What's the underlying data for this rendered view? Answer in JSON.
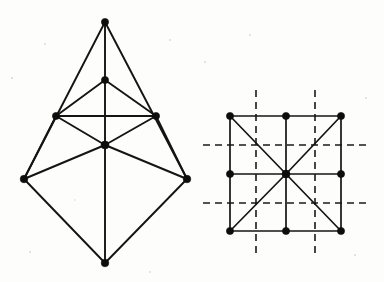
{
  "page": {
    "background_color": "#fdfdfb",
    "ink_color": "#141414",
    "width": 384,
    "height": 282
  },
  "figures": [
    {
      "id": "left-figure",
      "name": "triangulated-bipyramid-graph",
      "label": "",
      "vertex_count": 8,
      "edge_count": 15,
      "vertices": [
        {
          "name": "apex-top",
          "x": 105,
          "y": 22,
          "r": 3.6
        },
        {
          "name": "upper-middle",
          "x": 105,
          "y": 80,
          "r": 3.6
        },
        {
          "name": "left-upper-mid",
          "x": 56,
          "y": 116,
          "r": 3.6
        },
        {
          "name": "right-upper-mid",
          "x": 156,
          "y": 116,
          "r": 3.6
        },
        {
          "name": "center",
          "x": 105,
          "y": 145,
          "r": 4.0
        },
        {
          "name": "left-lower",
          "x": 24,
          "y": 179,
          "r": 3.8
        },
        {
          "name": "right-lower",
          "x": 187,
          "y": 179,
          "r": 3.8
        },
        {
          "name": "apex-bottom",
          "x": 105,
          "y": 263,
          "r": 3.8
        }
      ],
      "edges": [
        {
          "name": "edge-apex-top-to-left-lower",
          "from": 0,
          "to": 5
        },
        {
          "name": "edge-apex-top-to-right-lower",
          "from": 0,
          "to": 6
        },
        {
          "name": "edge-apex-top-to-upper-middle",
          "from": 0,
          "to": 1
        },
        {
          "name": "edge-upper-middle-to-left-upper",
          "from": 1,
          "to": 2
        },
        {
          "name": "edge-upper-middle-to-right-upper",
          "from": 1,
          "to": 3
        },
        {
          "name": "edge-upper-middle-to-center",
          "from": 1,
          "to": 4
        },
        {
          "name": "edge-left-upper-to-right-upper",
          "from": 2,
          "to": 3
        },
        {
          "name": "edge-left-upper-to-center",
          "from": 2,
          "to": 4
        },
        {
          "name": "edge-right-upper-to-center",
          "from": 3,
          "to": 4
        },
        {
          "name": "edge-left-lower-to-center",
          "from": 5,
          "to": 4
        },
        {
          "name": "edge-right-lower-to-center",
          "from": 6,
          "to": 4
        },
        {
          "name": "edge-center-to-apex-bottom",
          "from": 4,
          "to": 7
        },
        {
          "name": "edge-left-lower-to-apex-bottom",
          "from": 5,
          "to": 7
        },
        {
          "name": "edge-right-lower-to-apex-bottom",
          "from": 6,
          "to": 7
        },
        {
          "name": "edge-left-upper-to-left-lower",
          "from": 2,
          "to": 5
        },
        {
          "name": "edge-right-upper-to-right-lower",
          "from": 3,
          "to": 6
        }
      ]
    },
    {
      "id": "right-figure",
      "name": "square-grid-with-diagonals-and-mirror-axes",
      "label": "",
      "vertex_count": 9,
      "edge_count": 16,
      "vertices": [
        {
          "name": "grid-top-left",
          "x": 230,
          "y": 116,
          "r": 3.6
        },
        {
          "name": "grid-top-center",
          "x": 286,
          "y": 116,
          "r": 3.6
        },
        {
          "name": "grid-top-right",
          "x": 341,
          "y": 116,
          "r": 3.6
        },
        {
          "name": "grid-mid-left",
          "x": 230,
          "y": 174,
          "r": 3.6
        },
        {
          "name": "grid-center",
          "x": 286,
          "y": 174,
          "r": 4.0
        },
        {
          "name": "grid-mid-right",
          "x": 341,
          "y": 174,
          "r": 3.6
        },
        {
          "name": "grid-bottom-left",
          "x": 230,
          "y": 231,
          "r": 3.6
        },
        {
          "name": "grid-bottom-center",
          "x": 286,
          "y": 231,
          "r": 3.6
        },
        {
          "name": "grid-bottom-right",
          "x": 341,
          "y": 231,
          "r": 3.6
        }
      ],
      "edges": [
        {
          "name": "edge-top-row-left",
          "from": 0,
          "to": 1
        },
        {
          "name": "edge-top-row-right",
          "from": 1,
          "to": 2
        },
        {
          "name": "edge-mid-row-left",
          "from": 3,
          "to": 4
        },
        {
          "name": "edge-mid-row-right",
          "from": 4,
          "to": 5
        },
        {
          "name": "edge-bottom-row-left",
          "from": 6,
          "to": 7
        },
        {
          "name": "edge-bottom-row-right",
          "from": 7,
          "to": 8
        },
        {
          "name": "edge-left-col-upper",
          "from": 0,
          "to": 3
        },
        {
          "name": "edge-left-col-lower",
          "from": 3,
          "to": 6
        },
        {
          "name": "edge-center-col-upper",
          "from": 1,
          "to": 4
        },
        {
          "name": "edge-center-col-lower",
          "from": 4,
          "to": 7
        },
        {
          "name": "edge-right-col-upper",
          "from": 2,
          "to": 5
        },
        {
          "name": "edge-right-col-lower",
          "from": 5,
          "to": 8
        },
        {
          "name": "edge-diagonal-tl-center",
          "from": 0,
          "to": 4
        },
        {
          "name": "edge-diagonal-center-br",
          "from": 4,
          "to": 8
        },
        {
          "name": "edge-diagonal-tr-center",
          "from": 2,
          "to": 4
        },
        {
          "name": "edge-diagonal-center-bl",
          "from": 4,
          "to": 6
        }
      ],
      "mirror_axes": [
        {
          "name": "mirror-axis-vertical-left",
          "orientation": "vertical",
          "x1": 256,
          "y1": 90,
          "x2": 256,
          "y2": 257
        },
        {
          "name": "mirror-axis-vertical-right",
          "orientation": "vertical",
          "x1": 315,
          "y1": 90,
          "x2": 315,
          "y2": 257
        },
        {
          "name": "mirror-axis-horizontal-upper",
          "orientation": "horizontal",
          "x1": 203,
          "y1": 145,
          "x2": 371,
          "y2": 145
        },
        {
          "name": "mirror-axis-horizontal-lower",
          "orientation": "horizontal",
          "x1": 203,
          "y1": 203,
          "x2": 371,
          "y2": 203
        }
      ]
    }
  ],
  "specks": [
    {
      "name": "paper-speck",
      "x": 12,
      "y": 78,
      "r": 1.1
    },
    {
      "name": "paper-speck",
      "x": 45,
      "y": 44,
      "r": 0.9
    },
    {
      "name": "paper-speck",
      "x": 170,
      "y": 40,
      "r": 1.0
    },
    {
      "name": "paper-speck",
      "x": 205,
      "y": 62,
      "r": 1.0
    },
    {
      "name": "paper-speck",
      "x": 366,
      "y": 98,
      "r": 0.9
    },
    {
      "name": "paper-speck",
      "x": 30,
      "y": 252,
      "r": 1.0
    },
    {
      "name": "paper-speck",
      "x": 355,
      "y": 255,
      "r": 1.0
    },
    {
      "name": "paper-speck",
      "x": 150,
      "y": 272,
      "r": 0.9
    },
    {
      "name": "paper-speck",
      "x": 250,
      "y": 35,
      "r": 0.9
    },
    {
      "name": "paper-speck",
      "x": 75,
      "y": 200,
      "r": 0.8
    }
  ]
}
